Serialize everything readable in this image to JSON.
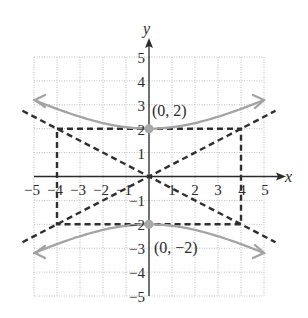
{
  "chart_data": {
    "type": "line",
    "title": "",
    "xlabel": "x",
    "ylabel": "y",
    "xlim": [
      -5,
      5
    ],
    "ylim": [
      -5,
      5
    ],
    "grid": true,
    "x_ticks": [
      "-5",
      "-4",
      "-3",
      "-2",
      "-1",
      "1",
      "2",
      "3",
      "4",
      "5"
    ],
    "y_ticks": [
      "5",
      "4",
      "3",
      "2",
      "1",
      "-1",
      "-2",
      "-3",
      "-4",
      "-5"
    ],
    "equation": "y^2/4 - x^2/16 = 1",
    "series": [
      {
        "name": "hyperbola-upper-branch",
        "style": "solid",
        "color": "#a3a3a3",
        "x": [
          -5,
          -4,
          -3,
          -2,
          -1,
          0,
          1,
          2,
          3,
          4,
          5
        ],
        "y": [
          3.2,
          2.83,
          2.5,
          2.24,
          2.06,
          2.0,
          2.06,
          2.24,
          2.5,
          2.83,
          3.2
        ]
      },
      {
        "name": "hyperbola-lower-branch",
        "style": "solid",
        "color": "#a3a3a3",
        "x": [
          -5,
          -4,
          -3,
          -2,
          -1,
          0,
          1,
          2,
          3,
          4,
          5
        ],
        "y": [
          -3.2,
          -2.83,
          -2.5,
          -2.24,
          -2.06,
          -2.0,
          -2.06,
          -2.24,
          -2.5,
          -2.83,
          -3.2
        ]
      },
      {
        "name": "asymptote-positive",
        "style": "dashed",
        "color": "#2e2e2e",
        "x": [
          -5.5,
          5.5
        ],
        "y": [
          -2.75,
          2.75
        ]
      },
      {
        "name": "asymptote-negative",
        "style": "dashed",
        "color": "#2e2e2e",
        "x": [
          -5.5,
          5.5
        ],
        "y": [
          2.75,
          -2.75
        ]
      },
      {
        "name": "central-rectangle",
        "style": "dashed",
        "color": "#2e2e2e",
        "x": [
          -4,
          4,
          4,
          -4,
          -4
        ],
        "y": [
          2,
          2,
          -2,
          -2,
          2
        ]
      }
    ],
    "points": [
      {
        "x": 0,
        "y": 2,
        "label": "(0, 2)"
      },
      {
        "x": 0,
        "y": -2,
        "label": "(0, −2)"
      }
    ],
    "colors": {
      "curve": "#a3a3a3",
      "dashed": "#2e2e2e",
      "axis": "#2a2a2a",
      "grid": "#bdbdbd",
      "vertex": "#a8a8a8"
    }
  },
  "labels": {
    "x_axis": "x",
    "y_axis": "y",
    "x_ticks": [
      "−5",
      "−4",
      "−3",
      "−2",
      "−1",
      "1",
      "2",
      "3",
      "4",
      "5"
    ],
    "y_ticks_pos": [
      "5",
      "4",
      "3",
      "2",
      "1"
    ],
    "y_ticks_neg": [
      "−1",
      "−2",
      "−3",
      "−4",
      "−5"
    ],
    "vertex_upper": "(0, 2)",
    "vertex_lower": "(0, −2)"
  }
}
